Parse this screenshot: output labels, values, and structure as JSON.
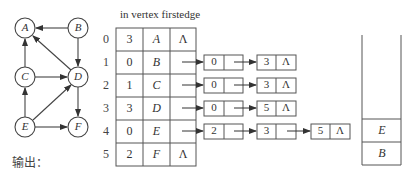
{
  "graph": {
    "nodes": [
      {
        "id": "A",
        "label": "A",
        "x": 25,
        "y": 28
      },
      {
        "id": "B",
        "label": "B",
        "x": 78,
        "y": 28
      },
      {
        "id": "C",
        "label": "C",
        "x": 25,
        "y": 77
      },
      {
        "id": "D",
        "label": "D",
        "x": 78,
        "y": 77
      },
      {
        "id": "E",
        "label": "E",
        "x": 25,
        "y": 127
      },
      {
        "id": "F",
        "label": "F",
        "x": 78,
        "y": 127
      }
    ],
    "edges": [
      {
        "from": "B",
        "to": "A"
      },
      {
        "from": "C",
        "to": "A"
      },
      {
        "from": "D",
        "to": "A"
      },
      {
        "from": "B",
        "to": "D"
      },
      {
        "from": "C",
        "to": "D"
      },
      {
        "from": "E",
        "to": "C"
      },
      {
        "from": "E",
        "to": "D"
      },
      {
        "from": "D",
        "to": "F"
      },
      {
        "from": "E",
        "to": "F"
      }
    ]
  },
  "table": {
    "header": "in vertex firstedge",
    "columns": [
      "in",
      "vertex",
      "firstedge"
    ],
    "rows": [
      {
        "index": "0",
        "in": "3",
        "vertex": "A",
        "firstedge": "Λ"
      },
      {
        "index": "1",
        "in": "0",
        "vertex": "B",
        "firstedge": ""
      },
      {
        "index": "2",
        "in": "1",
        "vertex": "C",
        "firstedge": ""
      },
      {
        "index": "3",
        "in": "3",
        "vertex": "D",
        "firstedge": ""
      },
      {
        "index": "4",
        "in": "0",
        "vertex": "E",
        "firstedge": ""
      },
      {
        "index": "5",
        "in": "2",
        "vertex": "F",
        "firstedge": "Λ"
      }
    ]
  },
  "adjacency_lists": [
    {
      "row": "1",
      "nodes": [
        {
          "adjvex": "0",
          "next": ""
        },
        {
          "adjvex": "3",
          "next": "Λ"
        }
      ]
    },
    {
      "row": "2",
      "nodes": [
        {
          "adjvex": "0",
          "next": ""
        },
        {
          "adjvex": "3",
          "next": "Λ"
        }
      ]
    },
    {
      "row": "3",
      "nodes": [
        {
          "adjvex": "0",
          "next": ""
        },
        {
          "adjvex": "5",
          "next": "Λ"
        }
      ]
    },
    {
      "row": "4",
      "nodes": [
        {
          "adjvex": "2",
          "next": ""
        },
        {
          "adjvex": "3",
          "next": ""
        },
        {
          "adjvex": "5",
          "next": "Λ"
        }
      ]
    }
  ],
  "stack": {
    "items": [
      "E",
      "B"
    ]
  },
  "output": {
    "label": "输出：",
    "value": ""
  },
  "colors": {
    "line": "#444444",
    "text": "#333333",
    "background": "#ffffff"
  }
}
